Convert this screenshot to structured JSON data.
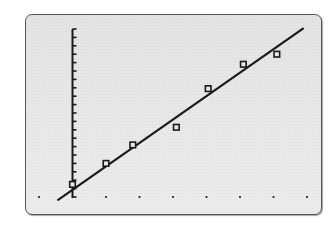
{
  "chart_data": {
    "type": "scatter",
    "title": "",
    "xlabel": "",
    "ylabel": "",
    "style": "graphing-calculator screen",
    "grid": false,
    "x_tick_dots": [
      -1,
      0,
      1,
      2,
      3,
      4,
      5,
      6,
      7
    ],
    "y_ticks": 20,
    "xlim": [
      -1,
      7
    ],
    "ylim": [
      0,
      20
    ],
    "series": [
      {
        "name": "data",
        "marker": "hollow-square",
        "x": [
          0,
          1.0,
          1.8,
          3.1,
          4.05,
          5.1,
          6.1
        ],
        "y": [
          1.5,
          4.0,
          6.2,
          8.3,
          12.9,
          15.8,
          17.0
        ]
      },
      {
        "name": "regression-line",
        "type": "line",
        "x": [
          -0.45,
          6.9
        ],
        "y": [
          -0.4,
          20.1
        ]
      }
    ]
  },
  "screen": {
    "background": "#e9e9e9",
    "border": "#555555",
    "ink": "#1a1a1a"
  }
}
